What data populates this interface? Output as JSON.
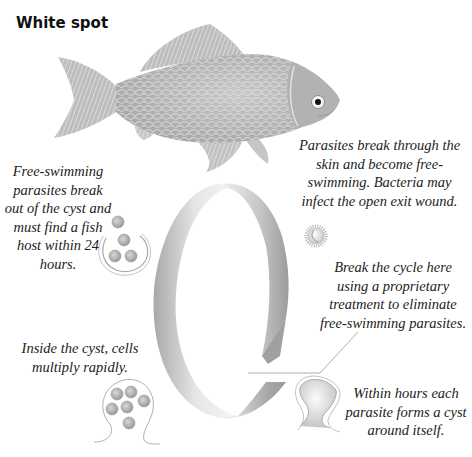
{
  "title": "White spot",
  "captions": {
    "free_swimming": "Free-swimming parasites break out of the cyst and must find a fish host within 24 hours.",
    "break_through": "Parasites break through the skin and become free-swimming. Bacteria may infect the open exit wound.",
    "break_cycle": "Break the cycle here using a proprietary treatment to eliminate free-swimming parasites.",
    "inside_cyst": "Inside the cyst, cells multiply rapidly.",
    "within_hours": "Within hours each parasite forms a cyst around itself."
  },
  "colors": {
    "ribbon_dark": "#9a9a9a",
    "ribbon_light": "#e8e8e8",
    "fish_body": "#b8b8b8",
    "text": "#222222"
  },
  "icons": {
    "fish": "fish-illustration",
    "ring": "lifecycle-ring-arrow",
    "cyst_open": "cyst-releasing-parasites-icon",
    "parasite": "parasite-trophont-icon",
    "cyst_forming": "cyst-forming-icon",
    "cyst_multiplying": "cyst-dividing-cells-icon"
  }
}
